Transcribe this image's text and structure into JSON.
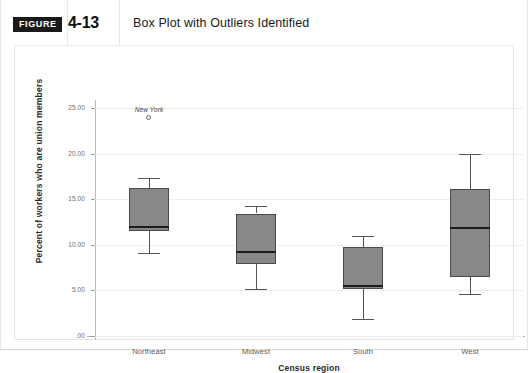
{
  "figure": {
    "badge_label": "FIGURE",
    "number": "4-13",
    "title": "Box Plot with Outliers Identified"
  },
  "chart_data": {
    "type": "box",
    "title": "Box Plot with Outliers Identified",
    "xlabel": "Census region",
    "ylabel": "Percent of workers who are union members",
    "categories": [
      "Northeast",
      "Midwest",
      "South",
      "West"
    ],
    "ytick_labels": [
      "25.00",
      "20.00",
      "15.00",
      "10.00",
      "5.00",
      ".00"
    ],
    "ytick_values": [
      25,
      20,
      15,
      10,
      5,
      0
    ],
    "ylim": [
      0,
      26.5
    ],
    "grid": "horizontal",
    "legend": "none",
    "boxes": [
      {
        "category": "Northeast",
        "whisker_low": 9.1,
        "q1": 11.5,
        "median": 12.1,
        "q3": 16.2,
        "whisker_high": 17.3,
        "outliers": [
          {
            "label": "New York",
            "value": 24.2
          }
        ]
      },
      {
        "category": "Midwest",
        "whisker_low": 5.2,
        "q1": 7.9,
        "median": 9.3,
        "q3": 13.4,
        "whisker_high": 14.2,
        "outliers": []
      },
      {
        "category": "South",
        "whisker_low": 1.9,
        "q1": 5.2,
        "median": 5.6,
        "q3": 9.8,
        "whisker_high": 11.0,
        "outliers": []
      },
      {
        "category": "West",
        "whisker_low": 4.6,
        "q1": 6.5,
        "median": 11.9,
        "q3": 16.1,
        "whisker_high": 20.0,
        "outliers": []
      }
    ],
    "colors": {
      "box_fill": "#888888",
      "box_border": "#4a4a4a",
      "median": "#1c1c1c",
      "whisker": "#555555",
      "gridline": "#ededed",
      "axis": "#b0b0b0",
      "badge_background": "#1a1a1a",
      "text": "#1a1a1a"
    }
  }
}
